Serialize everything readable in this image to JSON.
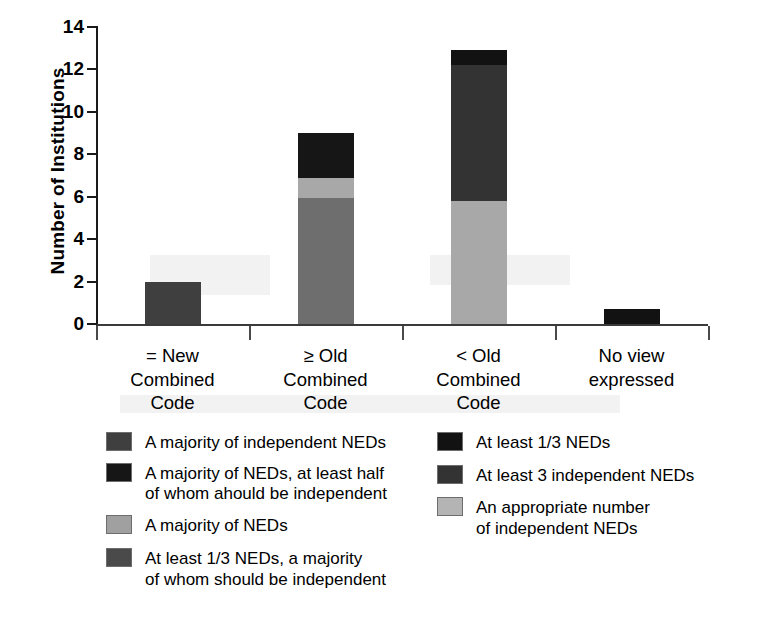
{
  "chart_data": {
    "type": "bar",
    "subtype": "stacked-vertical",
    "title": "",
    "xlabel": "",
    "ylabel": "Number of Institutions",
    "ylim": [
      0,
      14
    ],
    "yticks": [
      0,
      2,
      4,
      6,
      8,
      10,
      12,
      14
    ],
    "ytick_labels": [
      "0",
      "2",
      "4",
      "6",
      "8",
      "10",
      "12",
      "14"
    ],
    "grid": false,
    "legend_position": "below-plot-two-columns",
    "categories": [
      "= New\nCombined\nCode",
      "≥ Old\nCombined\nCode",
      "< Old\nCombined\nCode",
      "No view\nexpressed"
    ],
    "series": [
      {
        "name": "A majority of independent NEDs",
        "color": "#3f3f3f",
        "values": [
          2,
          0,
          0,
          0
        ]
      },
      {
        "name": "A majority of NEDs, at least half of whom ahould be independent",
        "color": "#161616",
        "values": [
          0,
          2,
          0,
          0
        ]
      },
      {
        "name": "A majority of NEDs",
        "color": "#6e6e6e",
        "values": [
          0,
          6,
          0,
          0
        ]
      },
      {
        "name": "At least 1/3 NEDs, a majority of whom should be independent",
        "color": "#4a4a4a",
        "values": [
          0,
          0,
          0,
          0
        ]
      },
      {
        "name": "At least 1/3 NEDs",
        "color": "#121212",
        "values": [
          0,
          0,
          0.7,
          0.7
        ]
      },
      {
        "name": "At least 3 independent NEDs",
        "color": "#333333",
        "values": [
          0,
          0,
          6.4,
          0
        ]
      },
      {
        "name": "An appropriate number of independent NEDs",
        "color": "#a8a8a8",
        "values": [
          0,
          1,
          5.8,
          0
        ]
      }
    ],
    "totals": [
      2,
      9,
      12.9,
      0.7
    ],
    "stacks": [
      {
        "category": "= New\nCombined\nCode",
        "segments": [
          {
            "label": "A majority of independent NEDs",
            "from": 0,
            "to": 2,
            "color": "#3f3f3f"
          }
        ]
      },
      {
        "category": "≥ Old\nCombined\nCode",
        "segments": [
          {
            "label": "A majority of NEDs",
            "from": 0,
            "to": 5.95,
            "color": "#6e6e6e"
          },
          {
            "label": "An appropriate number of independent NEDs",
            "from": 5.95,
            "to": 6.9,
            "color": "#a8a8a8"
          },
          {
            "label": "A majority of NEDs, at least half of whom ahould be independent",
            "from": 6.9,
            "to": 9,
            "color": "#161616"
          }
        ]
      },
      {
        "category": "< Old\nCombined\nCode",
        "segments": [
          {
            "label": "An appropriate number of independent NEDs",
            "from": 0,
            "to": 5.8,
            "color": "#a8a8a8"
          },
          {
            "label": "At least 3 independent NEDs",
            "from": 5.8,
            "to": 12.2,
            "color": "#333333"
          },
          {
            "label": "At least 1/3 NEDs",
            "from": 12.2,
            "to": 12.9,
            "color": "#121212"
          }
        ]
      },
      {
        "category": "No view\nexpressed",
        "segments": [
          {
            "label": "At least 1/3 NEDs",
            "from": 0,
            "to": 0.7,
            "color": "#121212"
          }
        ]
      }
    ]
  },
  "axis": {
    "ylabel": "Number of Institutions",
    "ytick_labels": [
      "14",
      "12",
      "10",
      "8",
      "6",
      "4",
      "2",
      "0"
    ],
    "xcat_labels": [
      "= New\nCombined\nCode",
      "≥ Old\nCombined\nCode",
      "< Old\nCombined\nCode",
      "No view\nexpressed"
    ]
  },
  "legend": {
    "left_column": [
      {
        "label": "A majority of independent NEDs",
        "color": "#3f3f3f"
      },
      {
        "label": "A majority of NEDs, at least half\nof whom ahould be independent",
        "color": "#161616"
      },
      {
        "label": "A majority of NEDs",
        "color": "#a0a0a0"
      },
      {
        "label": "At least 1/3 NEDs, a majority\nof whom should be independent",
        "color": "#4a4a4a"
      }
    ],
    "right_column": [
      {
        "label": "At least 1/3 NEDs",
        "color": "#121212"
      },
      {
        "label": "At least 3 independent NEDs",
        "color": "#333333"
      },
      {
        "label": "An appropriate number\nof independent NEDs",
        "color": "#b4b4b4"
      }
    ]
  }
}
